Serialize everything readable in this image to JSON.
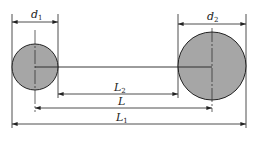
{
  "diagram": {
    "type": "dimension-drawing",
    "colors": {
      "fill": "#a6a6a6",
      "stroke": "#222222",
      "background": "#ffffff"
    },
    "circles": [
      {
        "id": "circle-1",
        "diameter_label": "d",
        "diameter_sub": "1",
        "cx": 35,
        "cy": 67,
        "r": 23
      },
      {
        "id": "circle-2",
        "diameter_label": "d",
        "diameter_sub": "2",
        "cx": 212,
        "cy": 66,
        "r": 34
      }
    ],
    "dimensions": [
      {
        "id": "L2",
        "label": "L",
        "sub": "2",
        "meaning": "edge-to-edge distance",
        "x1": 58,
        "x2": 178,
        "y": 94
      },
      {
        "id": "L",
        "label": "L",
        "sub": "",
        "meaning": "center-to-center distance",
        "x1": 35,
        "x2": 212,
        "y": 108
      },
      {
        "id": "L1",
        "label": "L",
        "sub": "1",
        "meaning": "overall outer distance",
        "x1": 12,
        "x2": 246,
        "y": 124
      }
    ],
    "labels": {
      "d1_main": "d",
      "d1_sub": "1",
      "d2_main": "d",
      "d2_sub": "2",
      "L2_main": "L",
      "L2_sub": "2",
      "L_main": "L",
      "L1_main": "L",
      "L1_sub": "1"
    }
  }
}
